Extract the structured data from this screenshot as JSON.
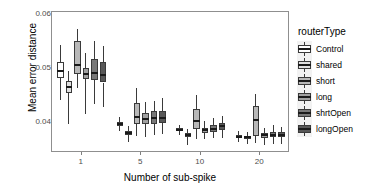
{
  "chart_data": {
    "type": "boxplot",
    "title": "",
    "xlabel": "Number of sub-spike",
    "ylabel": "Mean error distance",
    "ylim": [
      0.0345,
      0.0605
    ],
    "yticks": [
      0.04,
      0.05,
      0.06
    ],
    "ytick_labels": [
      "0.04",
      "0.05",
      "0.06"
    ],
    "categories": [
      "1",
      "5",
      "10",
      "20"
    ],
    "legend_title": "routerType",
    "legend_position": "right",
    "grid": false,
    "series": [
      {
        "name": "Control",
        "color": "#ffffff",
        "boxes": [
          {
            "category": "1",
            "min": 0.0443,
            "q1": 0.0483,
            "median": 0.0497,
            "q3": 0.0513,
            "max": 0.0545
          },
          {
            "category": "5",
            "min": 0.0385,
            "q1": 0.0395,
            "median": 0.0399,
            "q3": 0.0403,
            "max": 0.0412
          },
          {
            "category": "10",
            "min": 0.0378,
            "q1": 0.0385,
            "median": 0.0388,
            "q3": 0.0391,
            "max": 0.0397
          },
          {
            "category": "20",
            "min": 0.0366,
            "q1": 0.0372,
            "median": 0.0375,
            "q3": 0.0378,
            "max": 0.0385
          }
        ]
      },
      {
        "name": "shared",
        "color": "#e0e0e0",
        "boxes": [
          {
            "category": "1",
            "min": 0.0398,
            "q1": 0.0455,
            "median": 0.0467,
            "q3": 0.0478,
            "max": 0.0496
          },
          {
            "category": "5",
            "min": 0.0365,
            "q1": 0.0379,
            "median": 0.0382,
            "q3": 0.0385,
            "max": 0.0394
          },
          {
            "category": "10",
            "min": 0.036,
            "q1": 0.0374,
            "median": 0.0378,
            "q3": 0.0381,
            "max": 0.0389
          },
          {
            "category": "20",
            "min": 0.0362,
            "q1": 0.0371,
            "median": 0.0374,
            "q3": 0.0377,
            "max": 0.0384
          }
        ]
      },
      {
        "name": "short",
        "color": "#b8b8b8",
        "boxes": [
          {
            "category": "1",
            "min": 0.0464,
            "q1": 0.049,
            "median": 0.0508,
            "q3": 0.0551,
            "max": 0.0573
          },
          {
            "category": "5",
            "min": 0.0376,
            "q1": 0.0398,
            "median": 0.0412,
            "q3": 0.0437,
            "max": 0.0465
          },
          {
            "category": "10",
            "min": 0.0371,
            "q1": 0.0389,
            "median": 0.0404,
            "q3": 0.0426,
            "max": 0.0452
          },
          {
            "category": "20",
            "min": 0.0363,
            "q1": 0.0376,
            "median": 0.0405,
            "q3": 0.0432,
            "max": 0.0454
          }
        ]
      },
      {
        "name": "long",
        "color": "#a0a0a0",
        "boxes": [
          {
            "category": "1",
            "min": 0.0416,
            "q1": 0.0481,
            "median": 0.0491,
            "q3": 0.0501,
            "max": 0.053
          },
          {
            "category": "5",
            "min": 0.0374,
            "q1": 0.0399,
            "median": 0.0408,
            "q3": 0.0419,
            "max": 0.0439
          },
          {
            "category": "10",
            "min": 0.037,
            "q1": 0.0382,
            "median": 0.0387,
            "q3": 0.0392,
            "max": 0.0404
          },
          {
            "category": "20",
            "min": 0.0359,
            "q1": 0.0372,
            "median": 0.0378,
            "q3": 0.0382,
            "max": 0.0392
          }
        ]
      },
      {
        "name": "shrtOpen",
        "color": "#787878",
        "boxes": [
          {
            "category": "1",
            "min": 0.0435,
            "q1": 0.0479,
            "median": 0.0492,
            "q3": 0.0518,
            "max": 0.0552
          },
          {
            "category": "5",
            "min": 0.0379,
            "q1": 0.0399,
            "median": 0.041,
            "q3": 0.0422,
            "max": 0.0441
          },
          {
            "category": "10",
            "min": 0.0372,
            "q1": 0.0384,
            "median": 0.039,
            "q3": 0.0396,
            "max": 0.041
          },
          {
            "category": "20",
            "min": 0.0362,
            "q1": 0.0374,
            "median": 0.0379,
            "q3": 0.0383,
            "max": 0.0396
          }
        ]
      },
      {
        "name": "longOpen",
        "color": "#585858",
        "boxes": [
          {
            "category": "1",
            "min": 0.0429,
            "q1": 0.0475,
            "median": 0.0489,
            "q3": 0.0512,
            "max": 0.0542
          },
          {
            "category": "5",
            "min": 0.038,
            "q1": 0.04,
            "median": 0.041,
            "q3": 0.0423,
            "max": 0.0447
          },
          {
            "category": "10",
            "min": 0.0373,
            "q1": 0.0388,
            "median": 0.0394,
            "q3": 0.04,
            "max": 0.0414
          },
          {
            "category": "20",
            "min": 0.0362,
            "q1": 0.0374,
            "median": 0.0379,
            "q3": 0.0383,
            "max": 0.0393
          }
        ]
      }
    ]
  },
  "axes": {
    "ylabel": "Mean error distance",
    "xlabel": "Number of sub-spike",
    "ytick_labels": [
      "0.06",
      "0.05",
      "0.04"
    ],
    "xtick_labels": [
      "1",
      "5",
      "10",
      "20"
    ]
  },
  "legend": {
    "title": "routerType",
    "items": [
      {
        "label": "Control",
        "color": "#ffffff"
      },
      {
        "label": "shared",
        "color": "#e0e0e0"
      },
      {
        "label": "short",
        "color": "#b8b8b8"
      },
      {
        "label": "long",
        "color": "#a0a0a0"
      },
      {
        "label": "shrtOpen",
        "color": "#787878"
      },
      {
        "label": "longOpen",
        "color": "#585858"
      }
    ]
  }
}
